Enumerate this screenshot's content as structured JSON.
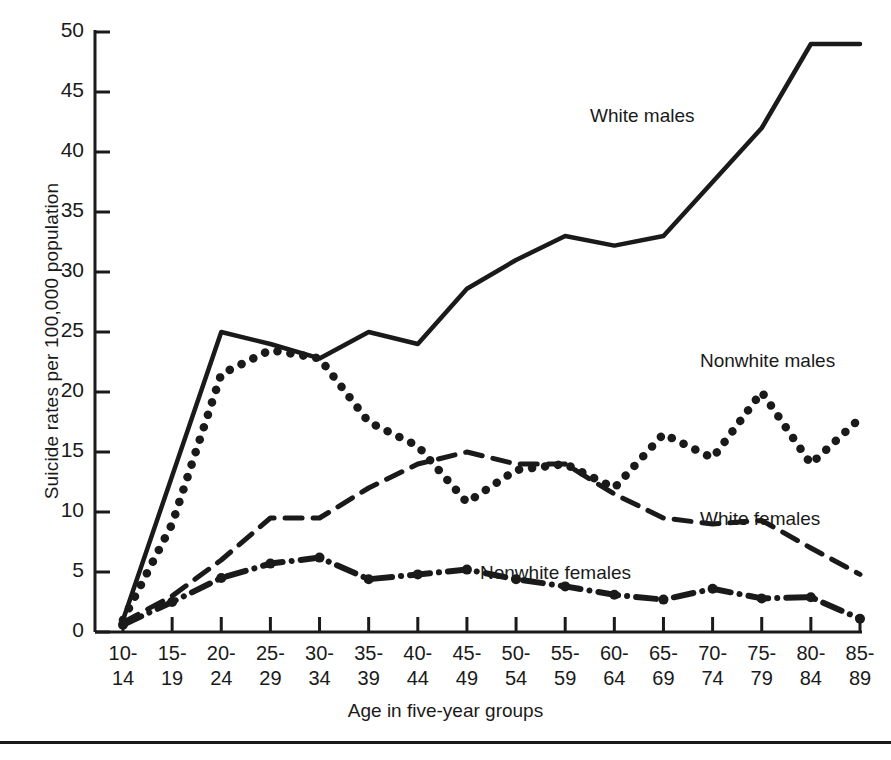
{
  "chart_data": {
    "type": "line",
    "title": "",
    "xlabel": "Age in five-year groups",
    "ylabel": "Suicide rates per 100,000 population",
    "ylim": [
      0,
      50
    ],
    "yticks": [
      0,
      5,
      10,
      15,
      20,
      25,
      30,
      35,
      40,
      45,
      50
    ],
    "ytick_labels": [
      "0",
      "5",
      "10",
      "15",
      "20",
      "25",
      "30",
      "35",
      "40",
      "45",
      "50"
    ],
    "grid": false,
    "legend_position": "inline-annotations",
    "categories": [
      "10-14",
      "15-19",
      "20-24",
      "25-29",
      "30-34",
      "35-39",
      "40-44",
      "45-49",
      "50-54",
      "55-59",
      "60-64",
      "65-69",
      "70-74",
      "75-79",
      "80-84",
      "85-89"
    ],
    "category_lines": [
      [
        "10-",
        "14"
      ],
      [
        "15-",
        "19"
      ],
      [
        "20-",
        "24"
      ],
      [
        "25-",
        "29"
      ],
      [
        "30-",
        "34"
      ],
      [
        "35-",
        "39"
      ],
      [
        "40-",
        "44"
      ],
      [
        "45-",
        "49"
      ],
      [
        "50-",
        "54"
      ],
      [
        "55-",
        "59"
      ],
      [
        "60-",
        "64"
      ],
      [
        "65-",
        "69"
      ],
      [
        "70-",
        "74"
      ],
      [
        "75-",
        "79"
      ],
      [
        "80-",
        "84"
      ],
      [
        "85-",
        "89"
      ]
    ],
    "series": [
      {
        "name": "White males",
        "style": "solid",
        "values": [
          1.0,
          13.0,
          25.0,
          24.0,
          22.8,
          25.0,
          24.0,
          28.6,
          31.0,
          33.0,
          32.2,
          33.0,
          37.5,
          42.0,
          49.0,
          49.0
        ]
      },
      {
        "name": "Nonwhite males",
        "style": "dotted",
        "values": [
          1.0,
          9.0,
          21.5,
          23.5,
          22.8,
          17.5,
          15.5,
          10.8,
          13.5,
          14.0,
          12.0,
          16.5,
          14.5,
          20.0,
          14.0,
          17.8
        ]
      },
      {
        "name": "White females",
        "style": "dashed",
        "values": [
          0.8,
          3.0,
          6.0,
          9.5,
          9.5,
          12.0,
          14.0,
          15.0,
          14.0,
          14.0,
          11.5,
          9.5,
          9.0,
          9.3,
          7.0,
          4.8
        ]
      },
      {
        "name": "Nonwhite females",
        "style": "dash-dot",
        "values": [
          0.6,
          2.5,
          4.5,
          5.7,
          6.2,
          4.4,
          4.8,
          5.2,
          4.4,
          3.8,
          3.1,
          2.7,
          3.6,
          2.8,
          2.9,
          1.1
        ]
      }
    ],
    "annotations": [
      {
        "text": "White males",
        "x_px": 590,
        "y_px": 105
      },
      {
        "text": "Nonwhite males",
        "x_px": 700,
        "y_px": 350
      },
      {
        "text": "White females",
        "x_px": 700,
        "y_px": 508
      },
      {
        "text": "Nonwhite females",
        "x_px": 480,
        "y_px": 562
      }
    ],
    "colors": {
      "ink": "#1a1a1a",
      "background": "#ffffff"
    }
  }
}
